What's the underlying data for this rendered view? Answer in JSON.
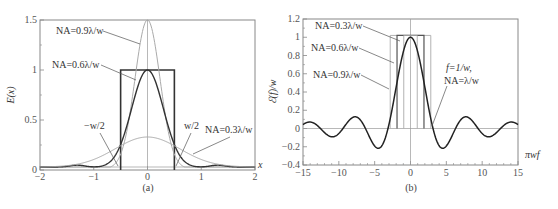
{
  "chart_data": [
    {
      "type": "line",
      "panel": "a",
      "caption": "(a)",
      "xlabel": "x",
      "ylabel": "E(x)",
      "xlim": [
        -2,
        2
      ],
      "ylim": [
        0,
        1.5
      ],
      "xticks": [
        -2,
        -1,
        0,
        1,
        2
      ],
      "xtick_labels": [
        "−2",
        "−1",
        "0",
        "1",
        "2"
      ],
      "yticks": [
        0,
        0.5,
        1,
        1.5
      ],
      "ytick_labels": [
        "0",
        "0.5",
        "1",
        "1.5"
      ],
      "grid": false,
      "rect": {
        "name": "object (rect w)",
        "x0": -0.5,
        "x1": 0.5,
        "height": 1.0
      },
      "series": [
        {
          "name": "NA=0.9λ/w",
          "color": "#aaaaaa",
          "peak": 1.5,
          "x": [
            -2,
            -1.5,
            -1,
            -0.8,
            -0.6,
            -0.4,
            -0.2,
            0,
            0.2,
            0.4,
            0.6,
            0.8,
            1,
            1.5,
            2
          ],
          "y": [
            0.03,
            0.03,
            0.02,
            0.0,
            0.05,
            0.5,
            1.2,
            1.5,
            1.2,
            0.5,
            0.05,
            0.0,
            0.02,
            0.03,
            0.03
          ]
        },
        {
          "name": "NA=0.6λ/w",
          "color": "#333333",
          "peak": 1.0,
          "x": [
            -2,
            -1.5,
            -1.3,
            -1,
            -0.8,
            -0.6,
            -0.4,
            -0.2,
            0,
            0.2,
            0.4,
            0.6,
            0.8,
            1,
            1.3,
            1.5,
            2
          ],
          "y": [
            0.03,
            0.03,
            0.05,
            0.03,
            0.07,
            0.3,
            0.62,
            0.9,
            1.0,
            0.9,
            0.62,
            0.3,
            0.07,
            0.03,
            0.05,
            0.03,
            0.03
          ]
        },
        {
          "name": "NA=0.3λ/w",
          "color": "#aaaaaa",
          "peak": 0.33,
          "x": [
            -2,
            -1.5,
            -1,
            -0.5,
            0,
            0.5,
            1,
            1.5,
            2
          ],
          "y": [
            0.03,
            0.07,
            0.17,
            0.28,
            0.33,
            0.28,
            0.17,
            0.07,
            0.03
          ]
        }
      ],
      "annotations": [
        "NA=0.9λ/w",
        "NA=0.6λ/w",
        "−w/2",
        "w/2",
        "NA=0.3λ/w"
      ]
    },
    {
      "type": "line",
      "panel": "b",
      "caption": "(b)",
      "xlabel": "πwf",
      "ylabel": "ℰ(f)/w",
      "xlim": [
        -15,
        15
      ],
      "ylim": [
        -0.4,
        1.2
      ],
      "xticks": [
        -15,
        -10,
        -5,
        0,
        5,
        10,
        15
      ],
      "xtick_labels": [
        "−15",
        "−10",
        "−5",
        "0",
        "5",
        "10",
        "15"
      ],
      "yticks": [
        -0.4,
        -0.2,
        0,
        0.2,
        0.4,
        0.6,
        0.8,
        1,
        1.2
      ],
      "ytick_labels": [
        "−0.4",
        "−0.2",
        "0",
        "0.2",
        "0.4",
        "0.6",
        "0.8",
        "1",
        "1.2"
      ],
      "grid": false,
      "series": [
        {
          "name": "sinc(πwf)",
          "function": "sin(u)/u",
          "color": "#222222"
        }
      ],
      "cutoffs": [
        {
          "name": "NA=0.3λ/w",
          "u": 0.94,
          "color": "#aaaaaa"
        },
        {
          "name": "NA=0.6λ/w",
          "u": 1.88,
          "color": "#555555"
        },
        {
          "name": "NA=0.9λ/w",
          "u": 2.83,
          "color": "#aaaaaa"
        }
      ],
      "cutoff_top": 1.02,
      "annotations": [
        "NA=0.3λ/w",
        "NA=0.6λ/w",
        "NA=0.9λ/w",
        "f=1/w,",
        "NA=λ/w"
      ]
    }
  ]
}
